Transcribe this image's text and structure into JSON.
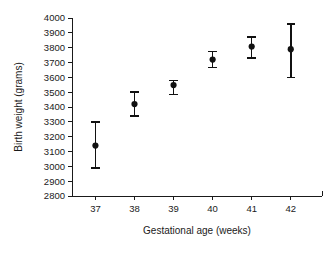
{
  "chart_data": {
    "type": "scatter",
    "title": "",
    "xlabel": "Gestational age (weeks)",
    "ylabel": "Birth weight (grams)",
    "x": [
      37,
      38,
      39,
      40,
      41,
      42
    ],
    "xtick_labels": [
      "37",
      "38",
      "39",
      "40",
      "41",
      "42"
    ],
    "xlim": [
      36.4,
      42.8
    ],
    "ylim": [
      2800,
      4000
    ],
    "ytick_labels": [
      "2800",
      "2900",
      "3000",
      "3100",
      "3200",
      "3300",
      "3400",
      "3500",
      "3600",
      "3700",
      "3800",
      "3900",
      "4000"
    ],
    "ytick_values": [
      2800,
      2900,
      3000,
      3100,
      3200,
      3300,
      3400,
      3500,
      3600,
      3700,
      3800,
      3900,
      4000
    ],
    "grid": false,
    "legend": "none",
    "marker": "filled-circle",
    "errorbar_style": "capped",
    "values": [
      3140,
      3420,
      3548,
      3720,
      3808,
      3790
    ],
    "error_low": [
      2990,
      3340,
      3485,
      3665,
      3730,
      3600
    ],
    "error_high": [
      3300,
      3500,
      3580,
      3775,
      3870,
      3960
    ],
    "series": [
      {
        "name": "Mean birth weight",
        "points": [
          {
            "x": 37,
            "y": 3140,
            "low": 2990,
            "high": 3300
          },
          {
            "x": 38,
            "y": 3420,
            "low": 3340,
            "high": 3500
          },
          {
            "x": 39,
            "y": 3548,
            "low": 3485,
            "high": 3580
          },
          {
            "x": 40,
            "y": 3720,
            "low": 3665,
            "high": 3775
          },
          {
            "x": 41,
            "y": 3808,
            "low": 3730,
            "high": 3870
          },
          {
            "x": 42,
            "y": 3790,
            "low": 3600,
            "high": 3960
          }
        ]
      }
    ],
    "colors": {
      "marker": "#111111",
      "axis": "#1a1a1a",
      "background": "#ffffff"
    }
  }
}
